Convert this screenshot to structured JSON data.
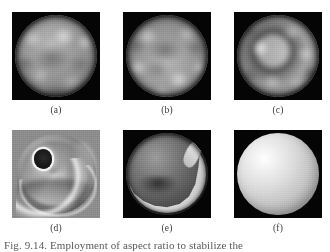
{
  "figure": {
    "caption": "Fig. 9.14.  Employment of aspect ratio to stabilize the",
    "layout": {
      "rows": 2,
      "columns": 3,
      "background_color": "#ffffff"
    },
    "panels": [
      {
        "id": "a",
        "label": "(a)",
        "kind": "endoscopic-grayscale-image",
        "background_color": "#050505",
        "description": "circular grayscale endoscopic frame, mottled bright blobs upper region, darker central depression"
      },
      {
        "id": "b",
        "label": "(b)",
        "kind": "endoscopic-grayscale-image",
        "background_color": "#050505",
        "description": "circular grayscale endoscopic frame, bright blobs lower-left and lower-centre, dark band across middle"
      },
      {
        "id": "c",
        "label": "(c)",
        "kind": "endoscopic-grayscale-image",
        "background_color": "#050505",
        "description": "circular grayscale endoscopic frame with dark ring/torus around bright left lobe"
      },
      {
        "id": "d",
        "label": "(d)",
        "kind": "shape-from-shading-reconstruction",
        "background_color": "#8d8d8d",
        "description": "3D reconstructed surface, dark elliptical hole upper-left, bright spiral ridges and crescent fold"
      },
      {
        "id": "e",
        "label": "(e)",
        "kind": "shape-from-shading-reconstruction",
        "background_color": "#050505",
        "description": "reconstructed sphere with bright crescent along lower-right limb and dark upper-left body"
      },
      {
        "id": "f",
        "label": "(f)",
        "kind": "shape-from-shading-reconstruction",
        "background_color": "#050505",
        "description": "smooth bright reconstructed sphere with specular highlight upper-left"
      }
    ]
  }
}
